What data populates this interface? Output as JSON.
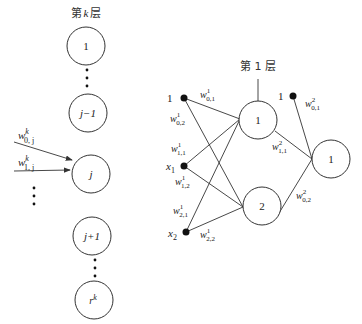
{
  "left_layer": {
    "title_pre": "第",
    "title_var": "k",
    "title_post": "层",
    "nodes": [
      {
        "label": "1"
      },
      {
        "label": "j−1"
      },
      {
        "label": "j"
      },
      {
        "label": "j+1"
      },
      {
        "label": "r",
        "sup": "k"
      }
    ],
    "weights": [
      {
        "base": "w",
        "sup": "k",
        "sub": "0, j"
      },
      {
        "base": "w",
        "sup": "k",
        "sub": "1, j"
      }
    ]
  },
  "right_network": {
    "layer_title": "第 1 层",
    "inputs": [
      {
        "label": "1"
      },
      {
        "label": "x",
        "sub": "1"
      },
      {
        "label": "x",
        "sub": "2"
      }
    ],
    "bias2_label": "1",
    "hidden_nodes": [
      {
        "label": "1"
      },
      {
        "label": "2"
      }
    ],
    "output_nodes": [
      {
        "label": "1"
      }
    ],
    "weights_layer1": [
      {
        "sup": "1",
        "sub": "0,1"
      },
      {
        "sup": "1",
        "sub": "0,2"
      },
      {
        "sup": "1",
        "sub": "1,1"
      },
      {
        "sup": "1",
        "sub": "1,2"
      },
      {
        "sup": "1",
        "sub": "2,1"
      },
      {
        "sup": "1",
        "sub": "2,2"
      }
    ],
    "weights_layer2": [
      {
        "sup": "2",
        "sub": "0,1"
      },
      {
        "sup": "2",
        "sub": "1,1"
      },
      {
        "sup": "2",
        "sub": "0,2"
      }
    ]
  }
}
